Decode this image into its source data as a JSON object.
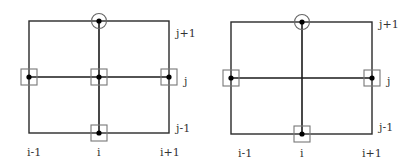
{
  "diagrams": [
    {
      "id": "stencil-left",
      "labels": {
        "row_top": "j+1",
        "row_mid": "j",
        "row_bottom": "j-1",
        "col_left": "i-1",
        "col_mid": "i",
        "col_right": "i+1"
      },
      "nodes": [
        {
          "position": "top-center",
          "marker": "circle"
        },
        {
          "position": "mid-left",
          "marker": "square"
        },
        {
          "position": "mid-center",
          "marker": "square"
        },
        {
          "position": "mid-right",
          "marker": "square"
        },
        {
          "position": "bottom-center",
          "marker": "square"
        }
      ]
    },
    {
      "id": "stencil-right",
      "labels": {
        "row_top": "j+1",
        "row_mid": "j",
        "row_bottom": "j-1",
        "col_left": "i-1",
        "col_mid": "i",
        "col_right": "i+1"
      },
      "nodes": [
        {
          "position": "top-center",
          "marker": "circle"
        },
        {
          "position": "mid-left",
          "marker": "square"
        },
        {
          "position": "mid-center",
          "marker": "none"
        },
        {
          "position": "mid-right",
          "marker": "square"
        },
        {
          "position": "bottom-center",
          "marker": "square"
        }
      ]
    }
  ],
  "colors": {
    "line": "#1a1a1a",
    "marker": "#777777",
    "node": "#000000",
    "background": "#ffffff"
  }
}
